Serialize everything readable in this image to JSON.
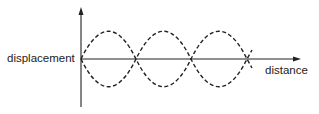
{
  "diagram": {
    "y_axis_label": "displacement",
    "x_axis_label": "distance",
    "colors": {
      "axis": "#222222",
      "wave": "#222222",
      "background": "#ffffff"
    },
    "nodes_count": 4,
    "antinodes_count": 3,
    "curve_style": "dashed"
  }
}
